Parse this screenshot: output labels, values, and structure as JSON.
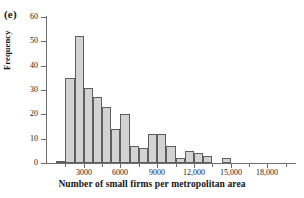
{
  "panel": {
    "label": "(e)"
  },
  "axes": {
    "ylabel": "Frequency",
    "xlabel": "Number of small firms per metropolitan area",
    "y_ticks": [
      0,
      10,
      20,
      30,
      40,
      50,
      60
    ],
    "y_tick_labels": [
      "0",
      "10",
      "20",
      "30",
      "40",
      "50",
      "60"
    ],
    "x_major_ticks": [
      3000,
      6000,
      9000,
      12000,
      15000,
      18000
    ],
    "x_major_tick_labels": [
      "3000",
      "6000",
      "9000",
      "12,000",
      "15,000",
      "18,000"
    ],
    "x_minor_ticks": [
      1500,
      4500,
      7500,
      10500,
      13500,
      16500,
      19500
    ]
  },
  "style": {
    "bar_fill": "#d3d3d3",
    "bar_stroke": "#5e5e5e",
    "axis_color": "#6d6d6d",
    "text_color": "#1a1a1a",
    "background": "#ffffff"
  },
  "chart_data": {
    "type": "bar",
    "title": "",
    "subtitle": "",
    "xlabel": "Number of small firms per metropolitan area",
    "ylabel": "Frequency",
    "xlim": [
      0,
      20250
    ],
    "ylim": [
      0,
      60
    ],
    "grid": false,
    "legend": null,
    "bin_width": 750,
    "bin_starts": [
      750,
      1500,
      2250,
      3000,
      3750,
      4500,
      5250,
      6000,
      6750,
      7500,
      8250,
      9000,
      9750,
      10500,
      11250,
      12000,
      12750,
      13500,
      14250,
      15000,
      15750,
      16500,
      17250,
      18000,
      18750,
      19500
    ],
    "categories": [
      "750-1500",
      "1500-2250",
      "2250-3000",
      "3000-3750",
      "3750-4500",
      "4500-5250",
      "5250-6000",
      "6000-6750",
      "6750-7500",
      "7500-8250",
      "8250-9000",
      "9000-9750",
      "9750-10500",
      "10500-11250",
      "11250-12000",
      "12000-12750",
      "12750-13500",
      "13500-14250",
      "14250-15000",
      "15000-15750",
      "15750-16500",
      "16500-17250",
      "17250-18000",
      "18000-18750",
      "18750-19500",
      "19500-20250"
    ],
    "values": [
      1,
      35,
      52,
      31,
      27,
      23,
      14,
      20,
      7,
      6,
      12,
      12,
      7,
      2,
      5,
      4,
      3,
      0,
      2,
      0,
      0,
      0,
      0,
      0,
      0,
      0
    ]
  }
}
